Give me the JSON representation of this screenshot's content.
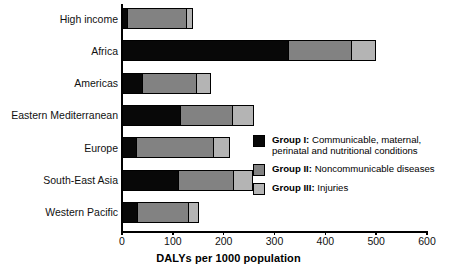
{
  "chart_data": {
    "type": "bar",
    "orientation": "horizontal",
    "stacked": true,
    "title": "",
    "xlabel": "DALYs per 1000 population",
    "ylabel": "",
    "xlim": [
      0,
      600
    ],
    "xticks": [
      0,
      100,
      200,
      300,
      400,
      500,
      600
    ],
    "grid": false,
    "legend_position": "inside-right",
    "categories": [
      "High income",
      "Africa",
      "Americas",
      "Eastern Mediterranean",
      "Europe",
      "South-East Asia",
      "Western Pacific"
    ],
    "series": [
      {
        "name": "Group I: Communicable, maternal, perinatal and nutritional conditions",
        "short_name": "Group I",
        "color": "#080808",
        "values": [
          10,
          327,
          40,
          115,
          28,
          110,
          30
        ]
      },
      {
        "name": "Group II: Noncommunicable diseases",
        "short_name": "Group II",
        "color": "#828282",
        "values": [
          116,
          124,
          106,
          102,
          152,
          109,
          100
        ]
      },
      {
        "name": "Group III: Injuries",
        "short_name": "Group III",
        "color": "#b4b4b4",
        "values": [
          12,
          47,
          27,
          41,
          30,
          37,
          20
        ]
      }
    ],
    "totals": [
      138,
      498,
      173,
      258,
      210,
      256,
      150
    ]
  },
  "legend": {
    "items": [
      {
        "color": "#080808",
        "bold": "Group I:",
        "rest": " Communicable, maternal, perinatal and nutritional conditions"
      },
      {
        "color": "#828282",
        "bold": "Group II:",
        "rest": " Noncommunicable diseases"
      },
      {
        "color": "#b4b4b4",
        "bold": "Group III:",
        "rest": " Injuries"
      }
    ]
  },
  "axis": {
    "x_title": "DALYs per 1000 population",
    "tick_labels": [
      "0",
      "100",
      "200",
      "300",
      "400",
      "500",
      "600"
    ]
  }
}
